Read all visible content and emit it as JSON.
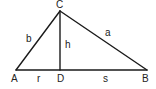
{
  "diagram": {
    "type": "right-triangle-altitude",
    "colors": {
      "stroke": "#1a1a1a",
      "text": "#222222",
      "background": "#ffffff"
    },
    "vertices": {
      "A": {
        "label": "A",
        "x": 16,
        "y": 70
      },
      "B": {
        "label": "B",
        "x": 147,
        "y": 70
      },
      "C": {
        "label": "C",
        "x": 60,
        "y": 11
      },
      "D": {
        "label": "D",
        "x": 60,
        "y": 70
      }
    },
    "segments": {
      "b": {
        "label": "b",
        "from": "A",
        "to": "C"
      },
      "a": {
        "label": "a",
        "from": "C",
        "to": "B"
      },
      "h": {
        "label": "h",
        "from": "C",
        "to": "D"
      },
      "r": {
        "label": "r",
        "from": "A",
        "to": "D"
      },
      "s": {
        "label": "s",
        "from": "D",
        "to": "B"
      }
    }
  }
}
